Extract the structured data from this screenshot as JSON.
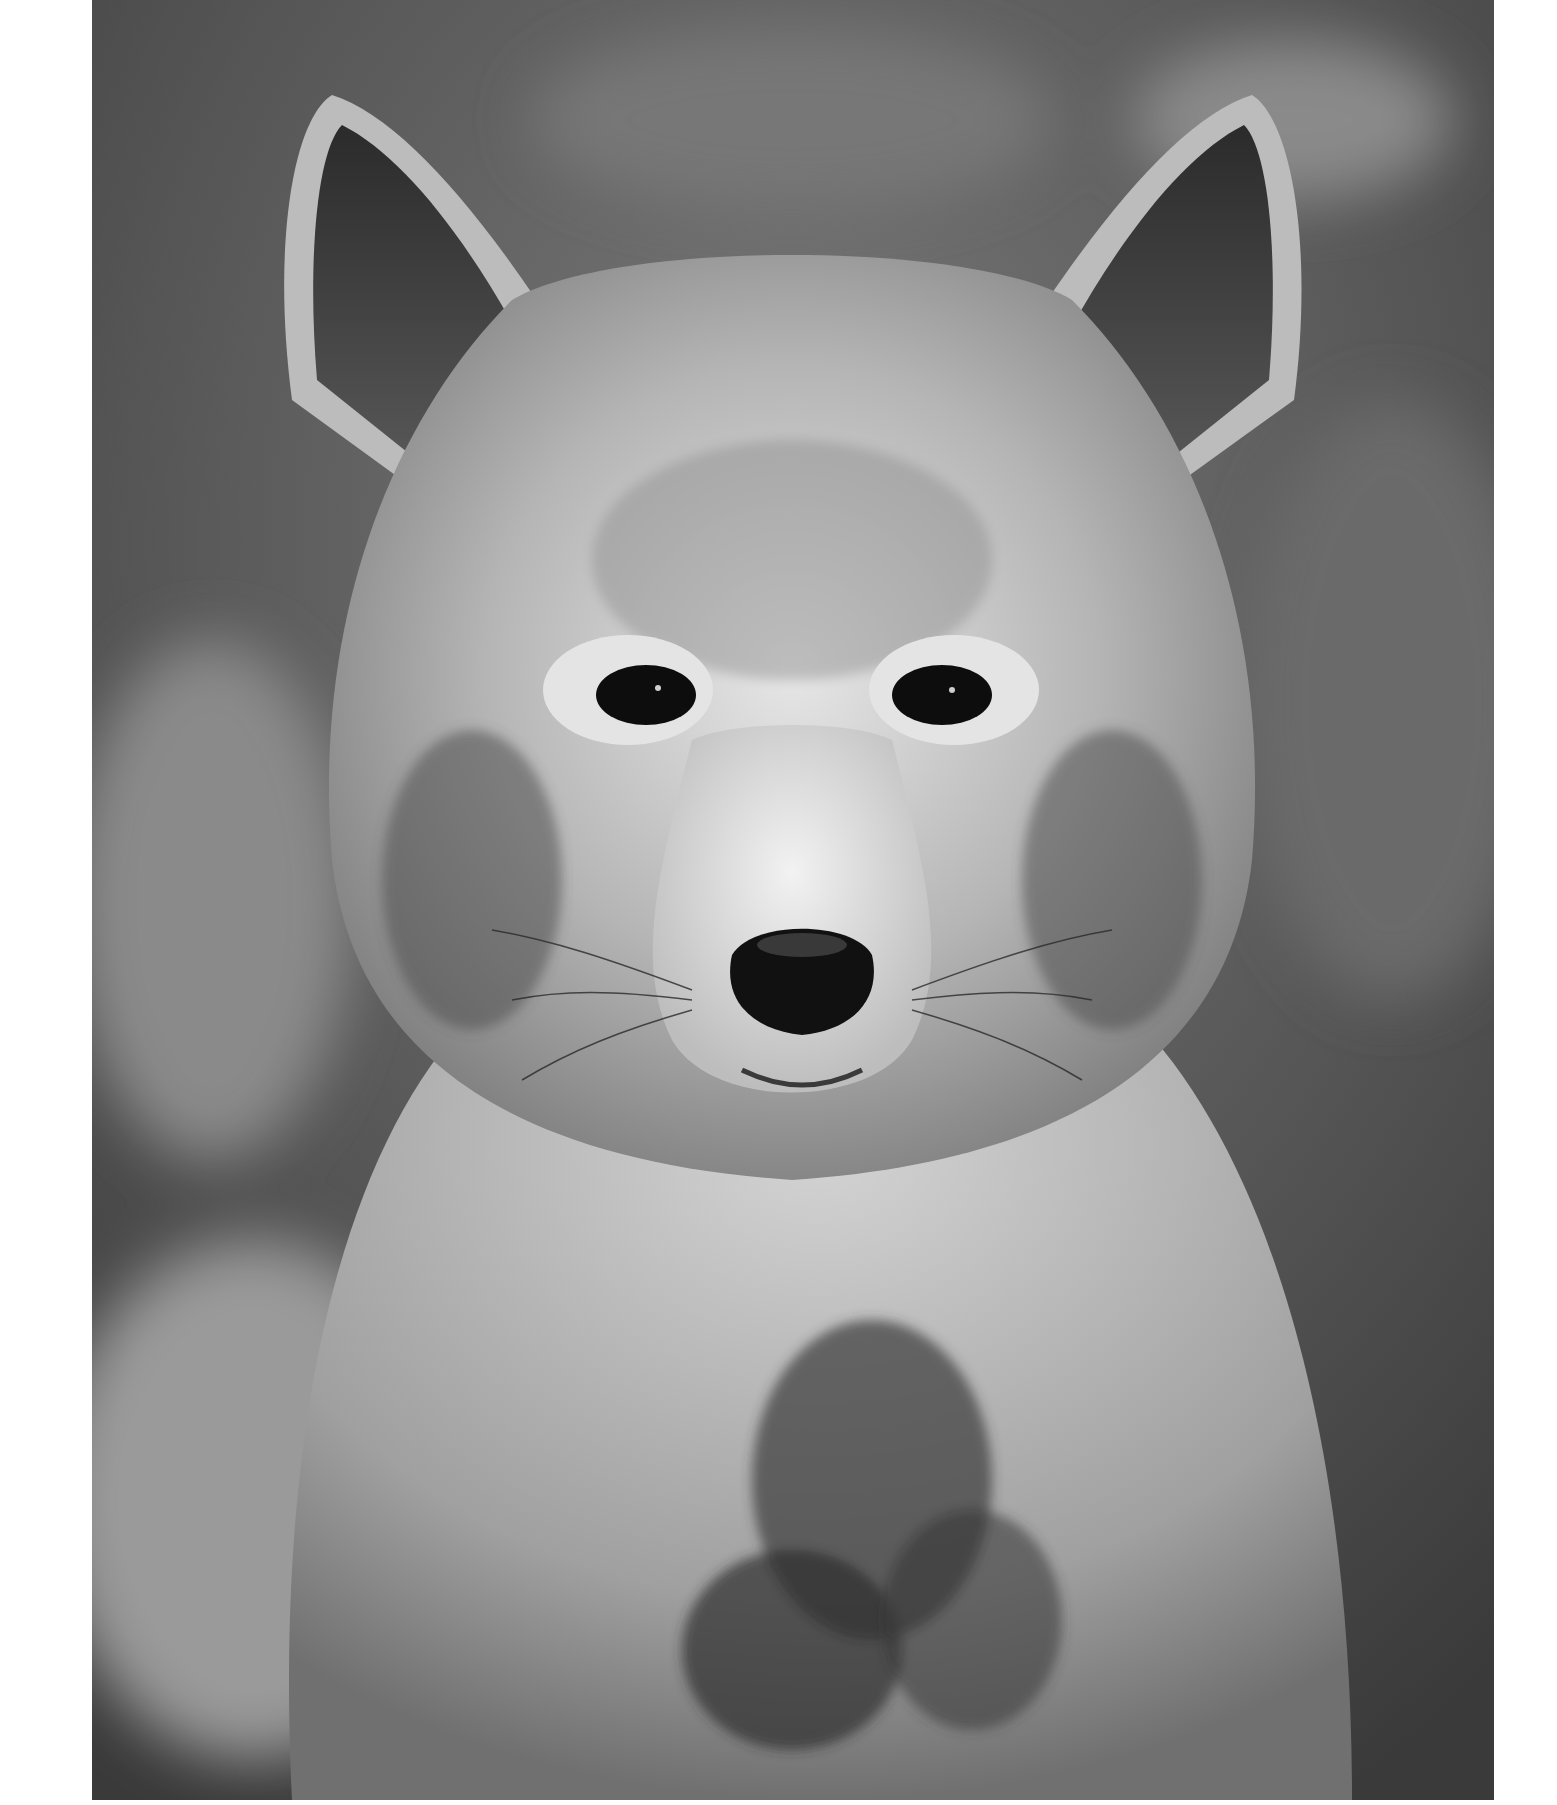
{
  "image": {
    "subject": "coyote portrait",
    "style": "black-and-white photograph",
    "colors": {
      "page_background": "#ffffff",
      "photo_background_dark": "#3e3e3e",
      "photo_background_mid": "#6e6e6e",
      "fur_light": "#d9d9d9",
      "fur_mid": "#a8a8a8",
      "fur_dark": "#4a4a4a",
      "eye": "#0d0d0d",
      "nose": "#111111"
    }
  }
}
